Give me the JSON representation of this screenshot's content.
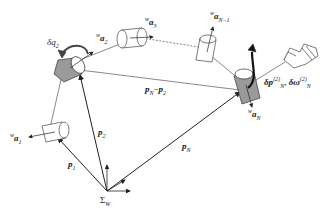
{
  "diagram": {
    "type": "robot-arm-kinematics",
    "frame": {
      "label_main": "Σ",
      "label_sub": "W"
    },
    "vectors": [
      {
        "id": "p1",
        "label_main": "p",
        "label_sub": "1"
      },
      {
        "id": "p2",
        "label_main": "p",
        "label_sub": "2"
      },
      {
        "id": "pN",
        "label_main": "p",
        "label_sub": "N"
      },
      {
        "id": "pN-p2",
        "label_main_a": "p",
        "label_sub_a": "N",
        "minus": "−",
        "label_main_b": "p",
        "label_sub_b": "2"
      }
    ],
    "joint_axes": [
      {
        "id": "a1",
        "pre": "w",
        "main": "a",
        "sub": "1"
      },
      {
        "id": "a2",
        "pre": "w",
        "main": "a",
        "sub": "2"
      },
      {
        "id": "a3",
        "pre": "w",
        "main": "a",
        "sub": "3"
      },
      {
        "id": "aN-1",
        "pre": "w",
        "main": "a",
        "sub": "N−1"
      },
      {
        "id": "aN",
        "pre": "w",
        "main": "a",
        "sub": "N"
      }
    ],
    "joint_rotation": {
      "main": "δq",
      "sub": "2"
    },
    "end_effector": {
      "dp_main": "δp",
      "dp_sup": "(2)",
      "dp_sub": "N",
      "sep": ",",
      "dw_main": "δω",
      "dw_sup": "(2)",
      "dw_sub": "N"
    }
  },
  "colors": {
    "line": "#333333",
    "shade": "#9a9a9a",
    "fill": "#ffffff"
  }
}
